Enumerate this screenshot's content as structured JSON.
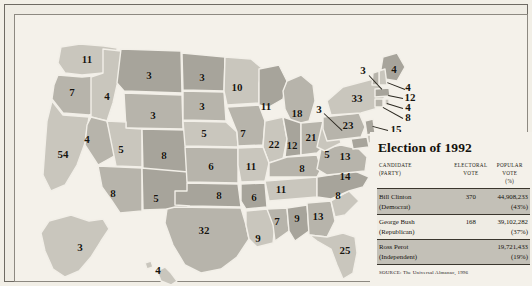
{
  "figure": {
    "title": "Election of 1992",
    "source": "SOURCE: The Universal Almanac, 1996"
  },
  "panel": {
    "headers": {
      "candidate": "CANDIDATE (PARTY)",
      "candidate_line1": "CANDIDATE",
      "candidate_line2": "(PARTY)",
      "electoral_line1": "ELECTORAL",
      "electoral_line2": "VOTE",
      "popular_line1": "POPULAR VOTE",
      "popular_line2": "(%)"
    },
    "rows": [
      {
        "candidate_line1": "Bill Clinton",
        "candidate_line2": "(Democrat)",
        "electoral_vote": "370",
        "popular_vote": "44,908,233",
        "popular_pct": "(43%)",
        "shaded": true
      },
      {
        "candidate_line1": "George Bush",
        "candidate_line2": "(Republican)",
        "electoral_vote": "168",
        "popular_vote": "39,102,282",
        "popular_pct": "(37%)",
        "shaded": false
      },
      {
        "candidate_line1": "Ross Perot",
        "candidate_line2": "(Independent)",
        "electoral_vote": "",
        "popular_vote": "19,721,433",
        "popular_pct": "(19%)",
        "shaded": true
      }
    ]
  },
  "colors": {
    "page_background": "#f4f1ea",
    "state_light": "#c9c6bd",
    "state_mid": "#b7b4ab",
    "state_dark": "#a7a49b",
    "state_border": "#f2efe8",
    "frame": "#6e6a63",
    "label_text": "#17150f",
    "table_shade": "#c3c0b7"
  },
  "map": {
    "title": "united-states-electoral-vote-map-1992",
    "states": [
      {
        "code": "WA",
        "name": "Washington",
        "electoral_votes": "11",
        "x": 62,
        "y": 34
      },
      {
        "code": "OR",
        "name": "Oregon",
        "electoral_votes": "7",
        "x": 47,
        "y": 67
      },
      {
        "code": "CA",
        "name": "California",
        "electoral_votes": "54",
        "x": 38,
        "y": 129
      },
      {
        "code": "NV",
        "name": "Nevada",
        "electoral_votes": "4",
        "x": 62,
        "y": 114
      },
      {
        "code": "ID",
        "name": "Idaho",
        "electoral_votes": "4",
        "x": 82,
        "y": 71
      },
      {
        "code": "MT",
        "name": "Montana",
        "electoral_votes": "3",
        "x": 124,
        "y": 50
      },
      {
        "code": "WY",
        "name": "Wyoming",
        "electoral_votes": "3",
        "x": 128,
        "y": 90
      },
      {
        "code": "UT",
        "name": "Utah",
        "electoral_votes": "5",
        "x": 96,
        "y": 124
      },
      {
        "code": "CO",
        "name": "Colorado",
        "electoral_votes": "8",
        "x": 139,
        "y": 130
      },
      {
        "code": "AZ",
        "name": "Arizona",
        "electoral_votes": "8",
        "x": 88,
        "y": 168
      },
      {
        "code": "NM",
        "name": "New Mexico",
        "electoral_votes": "5",
        "x": 131,
        "y": 173
      },
      {
        "code": "ND",
        "name": "North Dakota",
        "electoral_votes": "3",
        "x": 177,
        "y": 52
      },
      {
        "code": "SD",
        "name": "South Dakota",
        "electoral_votes": "3",
        "x": 177,
        "y": 81
      },
      {
        "code": "NE",
        "name": "Nebraska",
        "electoral_votes": "5",
        "x": 179,
        "y": 108
      },
      {
        "code": "KS",
        "name": "Kansas",
        "electoral_votes": "6",
        "x": 186,
        "y": 141
      },
      {
        "code": "OK",
        "name": "Oklahoma",
        "electoral_votes": "8",
        "x": 194,
        "y": 170
      },
      {
        "code": "TX",
        "name": "Texas",
        "electoral_votes": "32",
        "x": 179,
        "y": 205
      },
      {
        "code": "MN",
        "name": "Minnesota",
        "electoral_votes": "10",
        "x": 212,
        "y": 62
      },
      {
        "code": "IA",
        "name": "Iowa",
        "electoral_votes": "7",
        "x": 218,
        "y": 108
      },
      {
        "code": "MO",
        "name": "Missouri",
        "electoral_votes": "11",
        "x": 226,
        "y": 141
      },
      {
        "code": "AR",
        "name": "Arkansas",
        "electoral_votes": "6",
        "x": 229,
        "y": 172
      },
      {
        "code": "LA",
        "name": "Louisiana",
        "electoral_votes": "9",
        "x": 233,
        "y": 213
      },
      {
        "code": "WI",
        "name": "Wisconsin",
        "electoral_votes": "11",
        "x": 241,
        "y": 81
      },
      {
        "code": "IL",
        "name": "Illinois",
        "electoral_votes": "22",
        "x": 249,
        "y": 119
      },
      {
        "code": "MS",
        "name": "Mississippi",
        "electoral_votes": "7",
        "x": 252,
        "y": 196
      },
      {
        "code": "MI",
        "name": "Michigan",
        "electoral_votes": "18",
        "x": 272,
        "y": 88
      },
      {
        "code": "IN",
        "name": "Indiana",
        "electoral_votes": "12",
        "x": 267,
        "y": 120
      },
      {
        "code": "TN",
        "name": "Tennessee",
        "electoral_votes": "11",
        "x": 256,
        "y": 164
      },
      {
        "code": "AL",
        "name": "Alabama",
        "electoral_votes": "9",
        "x": 272,
        "y": 193
      },
      {
        "code": "OH",
        "name": "Ohio",
        "electoral_votes": "21",
        "x": 286,
        "y": 112
      },
      {
        "code": "KY",
        "name": "Kentucky",
        "electoral_votes": "8",
        "x": 277,
        "y": 143
      },
      {
        "code": "GA",
        "name": "Georgia",
        "electoral_votes": "13",
        "x": 293,
        "y": 191
      },
      {
        "code": "FL",
        "name": "Florida",
        "electoral_votes": "25",
        "x": 320,
        "y": 225
      },
      {
        "code": "WV",
        "name": "West Virginia",
        "electoral_votes": "5",
        "x": 302,
        "y": 129
      },
      {
        "code": "SC",
        "name": "South Carolina",
        "electoral_votes": "8",
        "x": 313,
        "y": 170
      },
      {
        "code": "NC",
        "name": "North Carolina",
        "electoral_votes": "14",
        "x": 320,
        "y": 151
      },
      {
        "code": "VA",
        "name": "Virginia",
        "electoral_votes": "13",
        "x": 320,
        "y": 131
      },
      {
        "code": "NY",
        "name": "New York",
        "electoral_votes": "33",
        "x": 332,
        "y": 73
      },
      {
        "code": "PA",
        "name": "Pennsylvania",
        "electoral_votes": "23",
        "x": 323,
        "y": 100
      },
      {
        "code": "AK",
        "name": "Alaska",
        "electoral_votes": "3",
        "x": 55,
        "y": 222
      },
      {
        "code": "HI",
        "name": "Hawaii",
        "electoral_votes": "4",
        "x": 133,
        "y": 245
      }
    ],
    "callouts": [
      {
        "code": "VT",
        "name": "Vermont",
        "electoral_votes": "3",
        "x": 338,
        "y": 45,
        "line": {
          "x1": 344,
          "y1": 50,
          "x2": 357,
          "y2": 64
        }
      },
      {
        "code": "ME",
        "name": "Maine",
        "electoral_votes": "4",
        "x": 369,
        "y": 44,
        "line": null
      },
      {
        "code": "NH",
        "name": "New Hampshire",
        "electoral_votes": "4",
        "x": 383,
        "y": 62,
        "line": {
          "x1": 380,
          "y1": 64,
          "x2": 362,
          "y2": 57
        }
      },
      {
        "code": "MA",
        "name": "Massachusetts",
        "electoral_votes": "12",
        "x": 385,
        "y": 72,
        "line": {
          "x1": 378,
          "y1": 73,
          "x2": 363,
          "y2": 70
        }
      },
      {
        "code": "RI",
        "name": "Rhode Island",
        "electoral_votes": "4",
        "x": 383,
        "y": 82,
        "line": {
          "x1": 378,
          "y1": 83,
          "x2": 362,
          "y2": 78
        }
      },
      {
        "code": "CT",
        "name": "Connecticut",
        "electoral_votes": "8",
        "x": 383,
        "y": 92,
        "line": {
          "x1": 378,
          "y1": 93,
          "x2": 358,
          "y2": 82
        }
      },
      {
        "code": "NJ",
        "name": "New Jersey",
        "electoral_votes": "15",
        "x": 371,
        "y": 104,
        "line": {
          "x1": 363,
          "y1": 105,
          "x2": 348,
          "y2": 101
        }
      },
      {
        "code": "DE",
        "name": "Delaware",
        "electoral_votes": "3",
        "x": 375,
        "y": 116,
        "line": {
          "x1": 369,
          "y1": 117,
          "x2": 350,
          "y2": 112
        }
      },
      {
        "code": "MD",
        "name": "Maryland",
        "electoral_votes": "10",
        "x": 374,
        "y": 127,
        "line": {
          "x1": 366,
          "y1": 127,
          "x2": 346,
          "y2": 120
        }
      },
      {
        "code": "DC",
        "name": "District of Columbia",
        "electoral_votes": "3",
        "x": 294,
        "y": 84,
        "line": {
          "x1": 299,
          "y1": 88,
          "x2": 317,
          "y2": 105
        }
      }
    ]
  }
}
